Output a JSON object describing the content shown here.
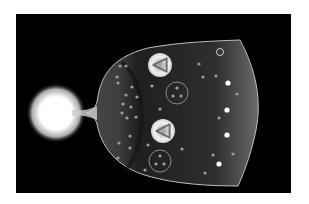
{
  "figure": {
    "background_color": "#000000",
    "border_color": "#ffffff",
    "origin_glow": {
      "cx": 56,
      "cy": 113,
      "r": 26,
      "color": "#ffffff"
    },
    "volume": {
      "fill_inner": "#3a3a3a",
      "fill_outer": "#5a5a5a",
      "edge_color": "#bdbdbd"
    },
    "triangle_markers": [
      {
        "cx": 160,
        "cy": 65,
        "r": 12
      },
      {
        "cx": 163,
        "cy": 131,
        "r": 12
      }
    ],
    "ring_markers": [
      {
        "cx": 177,
        "cy": 93,
        "r": 11
      },
      {
        "cx": 160,
        "cy": 161,
        "r": 11
      }
    ],
    "small_ring": {
      "cx": 220,
      "cy": 52,
      "r": 3.5
    },
    "dots": [
      [
        120,
        66
      ],
      [
        126,
        66
      ],
      [
        117,
        77
      ],
      [
        118,
        83
      ],
      [
        132,
        87
      ],
      [
        137,
        97
      ],
      [
        126,
        95
      ],
      [
        123,
        104
      ],
      [
        131,
        107
      ],
      [
        122,
        113
      ],
      [
        136,
        117
      ],
      [
        127,
        118
      ],
      [
        130,
        136
      ],
      [
        119,
        143
      ],
      [
        130,
        148
      ],
      [
        118,
        158
      ],
      [
        152,
        86
      ],
      [
        160,
        109
      ],
      [
        148,
        145
      ],
      [
        182,
        149
      ],
      [
        199,
        64
      ],
      [
        203,
        77
      ],
      [
        216,
        76
      ],
      [
        228,
        83
      ],
      [
        237,
        94
      ],
      [
        227,
        110
      ],
      [
        219,
        118
      ],
      [
        227,
        135
      ],
      [
        213,
        155
      ],
      [
        233,
        154
      ],
      [
        219,
        164
      ],
      [
        205,
        173
      ],
      [
        145,
        170
      ]
    ],
    "bright_dots": [
      [
        228,
        83
      ],
      [
        227,
        110
      ],
      [
        227,
        135
      ],
      [
        219,
        164
      ]
    ]
  }
}
